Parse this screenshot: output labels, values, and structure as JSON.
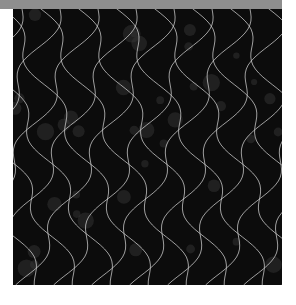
{
  "image": {
    "subject": "black fabric swatch with white wavy lattice pattern",
    "colors": {
      "background": "#ffffff",
      "top_band": "#8e8e8e",
      "fabric": "#0c0c0c",
      "lines": "#d8d8d8",
      "speckle": "#3a3a3a"
    },
    "pattern": {
      "type": "wavy-lattice",
      "spacing_px": 38,
      "amplitude_px": 9
    }
  }
}
